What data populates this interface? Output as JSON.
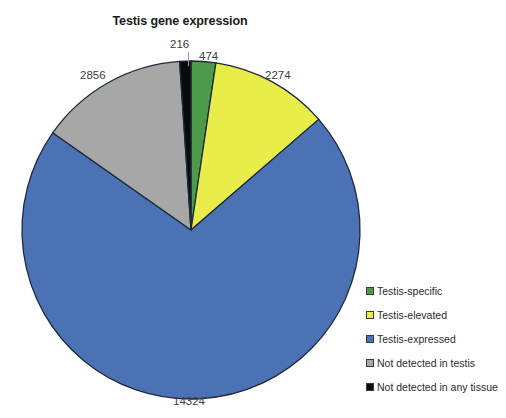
{
  "chart_data": {
    "type": "pie",
    "title": "Testis gene expression",
    "xlabel": "",
    "ylabel": "",
    "legend_position": "right",
    "total": 20144,
    "categories": [
      "Testis-specific",
      "Testis-elevated",
      "Testis-expressed",
      "Not detected in testis",
      "Not detected in any tissue"
    ],
    "values": [
      474,
      2274,
      14324,
      2856,
      216
    ],
    "colors": [
      "#4d9a4b",
      "#e9ed4a",
      "#4c72b6",
      "#a7a7a7",
      "#0b0b0b"
    ],
    "slice_labels": [
      "474",
      "2274",
      "14324",
      "2856",
      "216"
    ],
    "start_angle_deg": 0,
    "direction": "clockwise",
    "slices": [
      {
        "label": "Testis-specific",
        "value": 474,
        "value_text": "474",
        "color": "#4d9a4b"
      },
      {
        "label": "Testis-elevated",
        "value": 2274,
        "value_text": "2274",
        "color": "#e9ed4a"
      },
      {
        "label": "Testis-expressed",
        "value": 14324,
        "value_text": "14324",
        "color": "#4c72b6"
      },
      {
        "label": "Not detected in testis",
        "value": 2856,
        "value_text": "2856",
        "color": "#a7a7a7"
      },
      {
        "label": "Not detected in any tissue",
        "value": 216,
        "value_text": "216",
        "color": "#0b0b0b"
      }
    ]
  },
  "legend": {
    "items": [
      {
        "label": "Testis-specific",
        "color": "#4d9a4b"
      },
      {
        "label": "Testis-elevated",
        "color": "#e9ed4a"
      },
      {
        "label": "Testis-expressed",
        "color": "#4c72b6"
      },
      {
        "label": "Not detected in testis",
        "color": "#a7a7a7"
      },
      {
        "label": "Not detected in any tissue",
        "color": "#0b0b0b"
      }
    ]
  }
}
